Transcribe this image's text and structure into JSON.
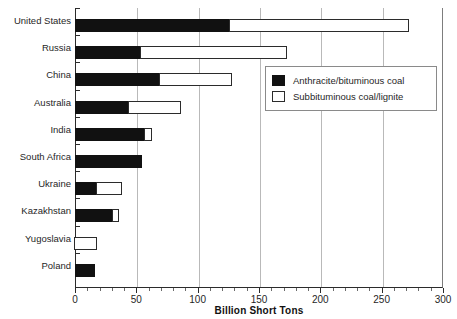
{
  "chart_data": {
    "type": "bar",
    "orientation": "horizontal",
    "stacked": true,
    "title": "",
    "xlabel": "Billion Short Tons",
    "ylabel": "",
    "xlim": [
      0,
      300
    ],
    "xticks": [
      0,
      50,
      100,
      150,
      200,
      250,
      300
    ],
    "xticklabels": [
      "0",
      "50",
      "100",
      "150",
      "200",
      "250",
      "300"
    ],
    "grid": "vertical",
    "legend_position": "upper right",
    "categories": [
      "United States",
      "Russia",
      "China",
      "Australia",
      "India",
      "South Africa",
      "Ukraine",
      "Kazakhstan",
      "Yugoslavia",
      "Poland"
    ],
    "series": [
      {
        "name": "Anthracite/bituminous coal",
        "pattern": "solid-black",
        "color": "#111111",
        "values": [
          126,
          54,
          69,
          44,
          57,
          55,
          18,
          31,
          0,
          16
        ]
      },
      {
        "name": "Subbituminous coal/lignite",
        "pattern": "dotted-white",
        "color": "#ffffff",
        "values": [
          147,
          120,
          60,
          43,
          7,
          0,
          21,
          6,
          19,
          0
        ]
      }
    ],
    "totals": [
      273,
      174,
      129,
      87,
      64,
      55,
      39,
      37,
      19,
      16
    ]
  },
  "legend": {
    "entries": [
      {
        "label": "Anthracite/bituminous coal",
        "swatch": "anthracite"
      },
      {
        "label": "Subbituminous coal/lignite",
        "swatch": "subbit"
      }
    ]
  },
  "axis": {
    "x_title": "Billion Short Tons"
  }
}
